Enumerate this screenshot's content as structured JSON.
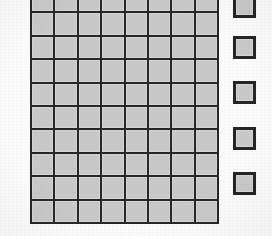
{
  "figure": {
    "background_color": "#fcfcfc",
    "width": 272,
    "height": 236
  },
  "main_grid": {
    "name": "square-lattice",
    "columns": 8,
    "rows": 10,
    "left": 31,
    "top": -11,
    "cell_size": 23.4,
    "cell_fill_color": "#c9c9c9",
    "cell_border_color": "#272727",
    "cell_border_width": 2,
    "top_row_clipped": true,
    "cells": [
      [
        "shaded",
        "shaded",
        "shaded",
        "shaded",
        "shaded",
        "shaded",
        "shaded",
        "shaded"
      ],
      [
        "shaded",
        "shaded",
        "shaded",
        "shaded",
        "shaded",
        "shaded",
        "shaded",
        "shaded"
      ],
      [
        "shaded",
        "shaded",
        "shaded",
        "shaded",
        "shaded",
        "shaded",
        "shaded",
        "shaded"
      ],
      [
        "shaded",
        "shaded",
        "shaded",
        "shaded",
        "shaded",
        "shaded",
        "shaded",
        "shaded"
      ],
      [
        "shaded",
        "shaded",
        "shaded",
        "shaded",
        "shaded",
        "shaded",
        "shaded",
        "shaded"
      ],
      [
        "shaded",
        "shaded",
        "shaded",
        "shaded",
        "shaded",
        "shaded",
        "shaded",
        "shaded"
      ],
      [
        "shaded",
        "shaded",
        "shaded",
        "shaded",
        "shaded",
        "shaded",
        "shaded",
        "shaded"
      ],
      [
        "shaded",
        "shaded",
        "shaded",
        "shaded",
        "shaded",
        "shaded",
        "shaded",
        "shaded"
      ],
      [
        "shaded",
        "shaded",
        "shaded",
        "shaded",
        "shaded",
        "shaded",
        "shaded",
        "shaded"
      ],
      [
        "shaded",
        "shaded",
        "shaded",
        "shaded",
        "shaded",
        "shaded",
        "shaded",
        "shaded"
      ]
    ]
  },
  "key_column": {
    "name": "key-squares",
    "count": 5,
    "fill_color": "#c9c9c9",
    "border_color": "#252525",
    "border_width": 3,
    "squares": [
      {
        "label": "key-square-1",
        "left": 233,
        "top": -5,
        "size": 23
      },
      {
        "label": "key-square-2",
        "left": 233,
        "top": 36,
        "size": 23
      },
      {
        "label": "key-square-3",
        "left": 233,
        "top": 81,
        "size": 23
      },
      {
        "label": "key-square-4",
        "left": 233,
        "top": 127,
        "size": 23
      },
      {
        "label": "key-square-5",
        "left": 233,
        "top": 172,
        "size": 23
      }
    ]
  }
}
